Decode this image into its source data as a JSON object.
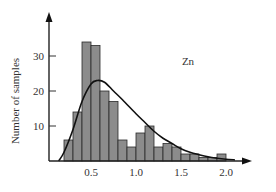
{
  "chart_data": {
    "type": "bar",
    "subtype": "histogram_with_density_curve",
    "title": "",
    "annotation": "Zn",
    "xlabel": "",
    "ylabel": "Number of samples",
    "xlim": [
      0.0,
      2.2
    ],
    "ylim": [
      0,
      37
    ],
    "x_ticks": [
      0.5,
      1.0,
      1.5,
      2.0
    ],
    "x_tick_labels": [
      "0.5",
      "1.0",
      "1.5",
      "2.0"
    ],
    "y_ticks": [
      10,
      20,
      30
    ],
    "y_tick_labels": [
      "10",
      "20",
      "30"
    ],
    "grid": false,
    "legend": null,
    "bin_width": 0.1,
    "bins": [
      {
        "start": 0.2,
        "end": 0.3,
        "count": 6
      },
      {
        "start": 0.3,
        "end": 0.4,
        "count": 14
      },
      {
        "start": 0.4,
        "end": 0.5,
        "count": 34
      },
      {
        "start": 0.5,
        "end": 0.6,
        "count": 33
      },
      {
        "start": 0.6,
        "end": 0.7,
        "count": 20
      },
      {
        "start": 0.7,
        "end": 0.8,
        "count": 17
      },
      {
        "start": 0.8,
        "end": 0.9,
        "count": 6
      },
      {
        "start": 0.9,
        "end": 1.0,
        "count": 4
      },
      {
        "start": 1.0,
        "end": 1.1,
        "count": 8
      },
      {
        "start": 1.1,
        "end": 1.2,
        "count": 10
      },
      {
        "start": 1.2,
        "end": 1.3,
        "count": 4
      },
      {
        "start": 1.3,
        "end": 1.4,
        "count": 5
      },
      {
        "start": 1.4,
        "end": 1.5,
        "count": 4
      },
      {
        "start": 1.5,
        "end": 1.6,
        "count": 2
      },
      {
        "start": 1.6,
        "end": 1.7,
        "count": 2
      },
      {
        "start": 1.7,
        "end": 1.8,
        "count": 1
      },
      {
        "start": 1.8,
        "end": 1.9,
        "count": 1
      },
      {
        "start": 1.9,
        "end": 2.0,
        "count": 2
      }
    ],
    "series": [
      {
        "name": "histogram",
        "type": "bar",
        "x": [
          0.25,
          0.35,
          0.45,
          0.55,
          0.65,
          0.75,
          0.85,
          0.95,
          1.05,
          1.15,
          1.25,
          1.35,
          1.45,
          1.55,
          1.65,
          1.75,
          1.85,
          1.95
        ],
        "values": [
          6,
          14,
          34,
          33,
          20,
          17,
          6,
          4,
          8,
          10,
          4,
          5,
          4,
          2,
          2,
          1,
          1,
          2
        ],
        "color": "#8c8c8c"
      },
      {
        "name": "fitted distribution",
        "type": "line",
        "x": [
          0.14,
          0.2,
          0.3,
          0.4,
          0.5,
          0.57,
          0.65,
          0.75,
          0.85,
          1.0,
          1.1,
          1.2,
          1.3,
          1.4,
          1.5,
          1.6,
          1.7,
          1.8,
          1.9,
          2.0,
          2.1
        ],
        "values": [
          0,
          2.5,
          9,
          17,
          22,
          23,
          22.5,
          20,
          17.5,
          13.5,
          11,
          8.5,
          6.5,
          5,
          3.5,
          2.5,
          1.8,
          1.2,
          0.8,
          0.5,
          0.3
        ],
        "color": "#111111"
      }
    ]
  },
  "plot": {
    "ylabel": "Number of samples",
    "annotation": "Zn",
    "x_tick_labels": [
      "0.5",
      "1.0",
      "1.5",
      "2.0"
    ],
    "y_tick_labels": [
      "10",
      "20",
      "30"
    ]
  }
}
